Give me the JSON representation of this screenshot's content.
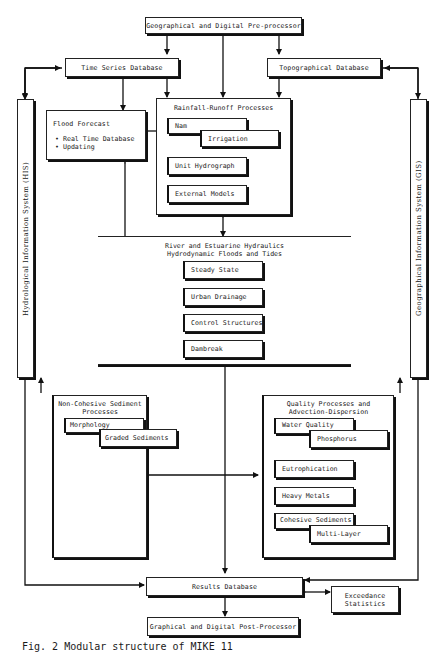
{
  "diagram": {
    "nodes": {
      "pre_processor": "Geographical and Digital Pre-processor",
      "time_series_db": "Time Series Database",
      "topographical_db": "Topographical Database",
      "flood_forecast": {
        "title": "Flood Forecast",
        "items": [
          "Real Time Database",
          "Updating"
        ]
      },
      "rainfall_runoff": {
        "title": "Rainfall-Runoff Processes",
        "items": [
          "Nam",
          "Irrigation",
          "Unit Hydrograph",
          "External Models"
        ]
      },
      "river_hydraulics": {
        "title_line1": "River and Estuarine Hydraulics",
        "title_line2": "Hydrodynamic Floods and Tides",
        "items": [
          "Steady State",
          "Urban Drainage",
          "Control Structures",
          "Dambreak"
        ]
      },
      "non_cohesive": {
        "title_line1": "Non-Cohesive Sediment",
        "title_line2": "Processes",
        "items": [
          "Morphology",
          "Graded Sediments"
        ]
      },
      "quality": {
        "title_line1": "Quality Processes and",
        "title_line2": "Advection-Dispersion",
        "items": [
          "Water Quality",
          "Phosphorus",
          "Eutrophication",
          "Heavy Metals",
          "Cohesive Sediments",
          "Multi-Layer"
        ]
      },
      "his": "Hydrological Information System (HIS)",
      "gis": "Geographical Information System (GIS)",
      "results_db": "Results Database",
      "exceedance": {
        "line1": "Exceedance",
        "line2": "Statistics"
      },
      "post_processor": "Graphical and Digital Post-Processor"
    },
    "caption": "Fig. 2  Modular structure of MIKE 11"
  }
}
